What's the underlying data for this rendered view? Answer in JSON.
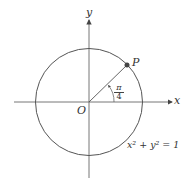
{
  "diagram": {
    "labels": {
      "x_axis": "x",
      "y_axis": "y",
      "origin": "O",
      "point": "P",
      "angle_numerator": "π",
      "angle_denominator": "4",
      "equation": "x² + y² = 1"
    },
    "colors": {
      "stroke": "#555555",
      "point": "#444444"
    }
  }
}
